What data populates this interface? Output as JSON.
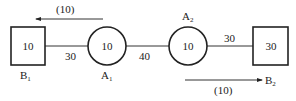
{
  "nodes": {
    "B1": {
      "label": "B",
      "sub": "1",
      "value": "10",
      "shape": "square"
    },
    "A1": {
      "label": "A",
      "sub": "1",
      "value": "10",
      "shape": "circle"
    },
    "A2": {
      "label": "A",
      "sub": "2",
      "value": "10",
      "shape": "circle"
    },
    "B2": {
      "label": "B",
      "sub": "2",
      "value": "30",
      "shape": "square"
    }
  },
  "edges": [
    {
      "from": "B1",
      "to": "A1",
      "weight": "30"
    },
    {
      "from": "A1",
      "to": "A2",
      "weight": "40"
    },
    {
      "from": "A2",
      "to": "B2",
      "weight": "30"
    }
  ],
  "flows": {
    "top": {
      "label": "(10)",
      "direction": "left"
    },
    "bottom": {
      "label": "(10)",
      "direction": "right",
      "target": "B2"
    }
  },
  "colors": {
    "stroke": "#222222",
    "background": "#ffffff"
  }
}
